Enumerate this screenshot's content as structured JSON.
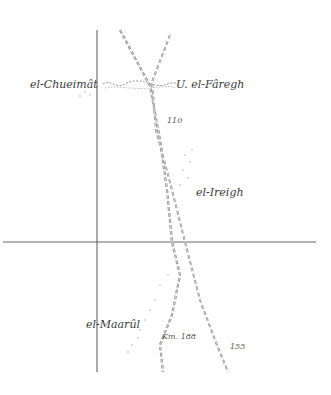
{
  "map": {
    "type": "hand-drawn route sketch map",
    "colors": {
      "ink": "#3a3a3a",
      "route": "#8a8a8a",
      "stipple": "#c8c8c8",
      "background": "#ffffff"
    },
    "places": [
      {
        "id": "chueimat",
        "label": "el-Chueimât",
        "x": 30,
        "y": 78
      },
      {
        "id": "faregh",
        "label": "U. el-Fâregh",
        "x": 176,
        "y": 78
      },
      {
        "id": "ireigh",
        "label": "el-Ireigh",
        "x": 196,
        "y": 186
      },
      {
        "id": "maarul",
        "label": "el-Maarûl",
        "x": 86,
        "y": 318
      }
    ],
    "markers": [
      {
        "id": "m110",
        "label": "110",
        "x": 167,
        "y": 116
      },
      {
        "id": "km188",
        "label": "Km. 188",
        "x": 162,
        "y": 332
      },
      {
        "id": "m155",
        "label": "155",
        "x": 230,
        "y": 342
      }
    ],
    "grid": {
      "vertical": {
        "x": 97,
        "y1": 30,
        "y2": 372
      },
      "horizontal": {
        "y": 242,
        "x1": 3,
        "x2": 316
      }
    }
  }
}
